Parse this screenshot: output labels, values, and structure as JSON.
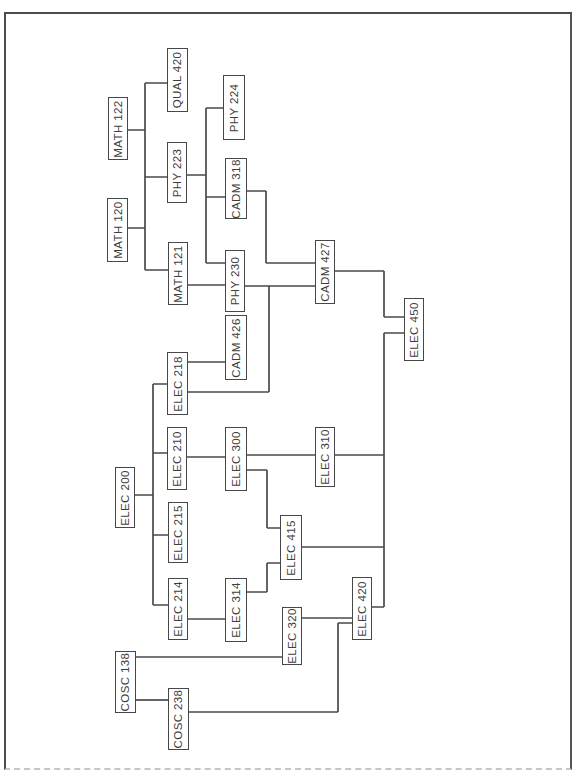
{
  "diagram": {
    "kind": "course-prerequisite-flowchart",
    "orientation": "rotated-90 (labels read bottom-to-top)",
    "line_color": "#4a4a4a",
    "background_color": "#ffffff",
    "nodes": [
      {
        "label": "MATH 122"
      },
      {
        "label": "QUAL 420"
      },
      {
        "label": "PHY 224"
      },
      {
        "label": "MATH 120"
      },
      {
        "label": "PHY 223"
      },
      {
        "label": "CADM 318"
      },
      {
        "label": "MATH 121"
      },
      {
        "label": "PHY 230"
      },
      {
        "label": "CADM 426"
      },
      {
        "label": "CADM 427"
      },
      {
        "label": "ELEC 218"
      },
      {
        "label": "ELEC 450"
      },
      {
        "label": "ELEC 210"
      },
      {
        "label": "ELEC 300"
      },
      {
        "label": "ELEC 310"
      },
      {
        "label": "ELEC 200"
      },
      {
        "label": "ELEC 215"
      },
      {
        "label": "ELEC 415"
      },
      {
        "label": "ELEC 214"
      },
      {
        "label": "ELEC 314"
      },
      {
        "label": "ELEC 320"
      },
      {
        "label": "ELEC 420"
      },
      {
        "label": "COSC 138"
      },
      {
        "label": "COSC 238"
      }
    ],
    "edges": [
      {
        "sources": [
          "MATH 122",
          "MATH 120"
        ],
        "targets": [
          "QUAL 420",
          "PHY 223",
          "MATH 121"
        ]
      },
      {
        "sources": [
          "PHY 223"
        ],
        "targets": [
          "PHY 224",
          "CADM 318",
          "PHY 230"
        ]
      },
      {
        "sources": [
          "MATH 121"
        ],
        "targets": [
          "PHY 230"
        ]
      },
      {
        "sources": [
          "CADM 318"
        ],
        "targets": [
          "CADM 427"
        ]
      },
      {
        "sources": [
          "PHY 230",
          "ELEC 218"
        ],
        "targets": [
          "CADM 427"
        ]
      },
      {
        "sources": [
          "ELEC 218"
        ],
        "targets": [
          "CADM 426"
        ]
      },
      {
        "sources": [
          "ELEC 200"
        ],
        "targets": [
          "ELEC 218",
          "ELEC 210",
          "ELEC 215",
          "ELEC 214"
        ]
      },
      {
        "sources": [
          "ELEC 210"
        ],
        "targets": [
          "ELEC 300"
        ]
      },
      {
        "sources": [
          "ELEC 300"
        ],
        "targets": [
          "ELEC 310",
          "ELEC 415"
        ]
      },
      {
        "sources": [
          "ELEC 314"
        ],
        "targets": [
          "ELEC 415"
        ]
      },
      {
        "sources": [
          "ELEC 214"
        ],
        "targets": [
          "ELEC 314"
        ]
      },
      {
        "sources": [
          "COSC 138"
        ],
        "targets": [
          "ELEC 320",
          "COSC 238"
        ]
      },
      {
        "sources": [
          "ELEC 320"
        ],
        "targets": [
          "ELEC 420"
        ]
      },
      {
        "sources": [
          "COSC 238"
        ],
        "targets": [
          "ELEC 420"
        ]
      },
      {
        "sources": [
          "CADM 427"
        ],
        "targets": [
          "ELEC 450"
        ]
      },
      {
        "sources": [
          "ELEC 310",
          "ELEC 415",
          "ELEC 420"
        ],
        "targets": [
          "ELEC 450"
        ]
      }
    ]
  }
}
